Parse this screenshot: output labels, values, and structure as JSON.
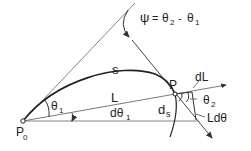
{
  "diagram": {
    "title_formula": "ψ = θ2 - θ1",
    "labels": {
      "psi": "ψ",
      "eq": "=",
      "theta2_main": "θ",
      "theta2_sub": "2",
      "minus": "-",
      "theta1_main": "θ",
      "theta1_sub": "1",
      "s": "s",
      "P": "P",
      "dL": "dL",
      "angle_theta1": "θ",
      "angle_theta1_sub": "1",
      "L": "L",
      "dtheta1": "dθ",
      "dtheta1_sub": "1",
      "angle_theta2": "θ",
      "angle_theta2_sub": "2",
      "ds": "d",
      "ds_sub": "s",
      "Ldtheta": "Ldθ",
      "P0": "P",
      "P0_sub": "0"
    },
    "colors": {
      "line": "#333333",
      "background": "#ffffff"
    }
  }
}
